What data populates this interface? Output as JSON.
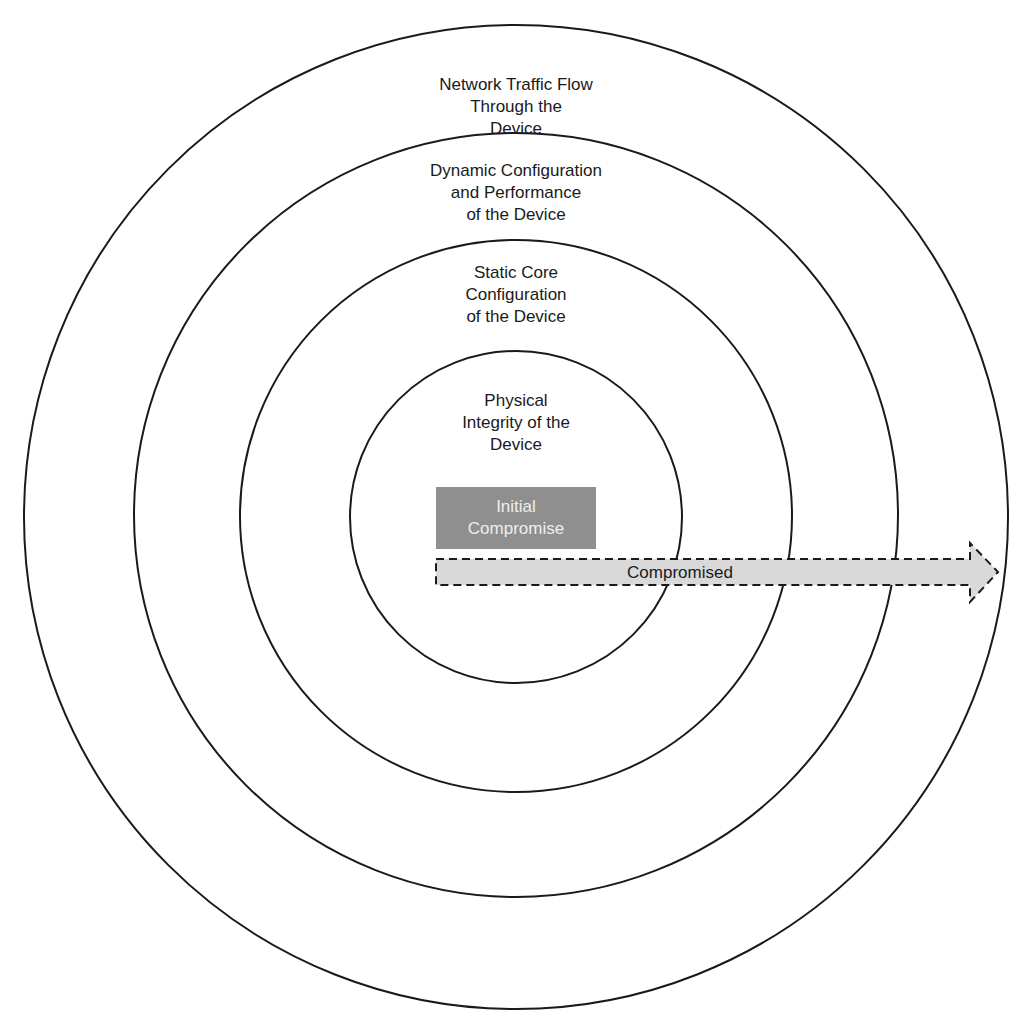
{
  "diagram": {
    "type": "concentric-layers",
    "rings": [
      {
        "id": "outer",
        "label": "Network Traffic Flow\nThrough the\nDevice",
        "radius": 492
      },
      {
        "id": "ring2",
        "label": "Dynamic Configuration\nand Performance\nof the Device",
        "radius": 383
      },
      {
        "id": "ring3",
        "label": "Static Core\nConfiguration\nof the Device",
        "radius": 276
      },
      {
        "id": "inner",
        "label": "Physical\nIntegrity of the\nDevice",
        "radius": 166
      }
    ],
    "center": {
      "x": 516,
      "y": 516
    },
    "initial_box": {
      "label": "Initial\nCompromise",
      "color": "#8f8f8f"
    },
    "arrow": {
      "label": "Compromised",
      "fill": "#d9d9d9",
      "stroke": "#1a1a1a",
      "style": "dashed"
    },
    "colors": {
      "line": "#1a1a1a",
      "background": "#ffffff"
    }
  }
}
